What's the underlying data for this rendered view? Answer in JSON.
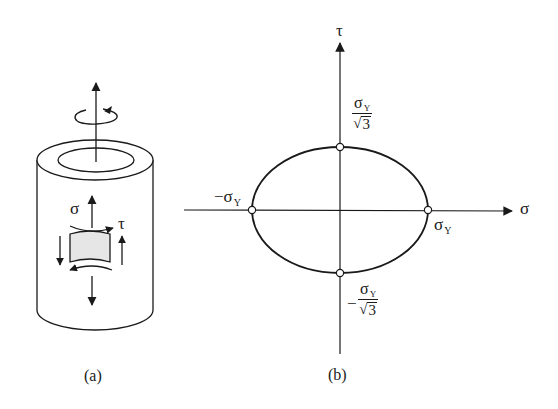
{
  "figure": {
    "panel_a": {
      "caption": "(a)",
      "stress_labels": {
        "normal": "σ",
        "shear": "τ"
      },
      "description": "Thin-walled tube under axial load and torsion with stress element"
    },
    "panel_b": {
      "caption": "(b)",
      "axes": {
        "x_label": "σ",
        "y_label": "τ"
      },
      "points": {
        "right": {
          "symbol": "σ",
          "subscript": "Y"
        },
        "left": {
          "prefix": "−",
          "symbol": "σ",
          "subscript": "Y"
        },
        "top": {
          "num_symbol": "σ",
          "num_subscript": "Y",
          "den_radical": "√",
          "den_radicand": "3"
        },
        "bottom": {
          "prefix": "−",
          "num_symbol": "σ",
          "num_subscript": "Y",
          "den_radical": "√",
          "den_radicand": "3"
        }
      },
      "curve": "ellipse (von Mises yield locus in σ–τ plane)"
    },
    "colors": {
      "ink": "#1a1a1a",
      "element_fill": "#e6e6e6",
      "background": "#ffffff"
    }
  }
}
